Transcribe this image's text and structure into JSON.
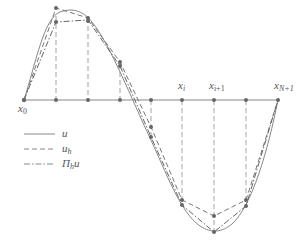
{
  "diagram": {
    "title": "",
    "colors": {
      "axis": "#888888",
      "curve": "#777777",
      "node": "#666666",
      "text": "#555555"
    },
    "axis_labels": {
      "x0": "x",
      "x0_sub": "0",
      "xi": "x",
      "xi_sub": "i",
      "xi1": "x",
      "xi1_sub": "i+1",
      "xN1": "x",
      "xN1_sub": "N+1"
    },
    "legend": [
      {
        "style": "solid",
        "label": "u",
        "sub": ""
      },
      {
        "style": "dashed",
        "label": "u",
        "sub": "h"
      },
      {
        "style": "dash-dot",
        "label": "Π",
        "sub": "h",
        "suffix": "u"
      }
    ],
    "nodes_x": [
      24,
      56,
      88,
      120,
      151,
      182,
      214,
      246,
      278
    ],
    "axis_y": 100
  }
}
